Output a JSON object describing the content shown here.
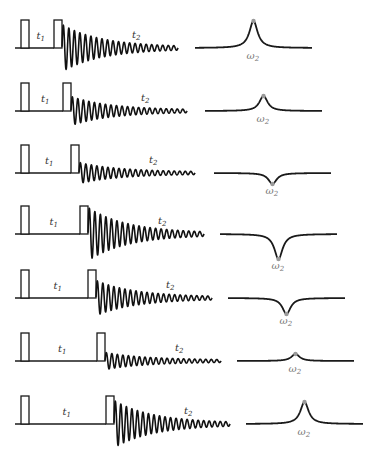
{
  "diagram": {
    "title": "",
    "labels": {
      "t1": "t",
      "t1_sub": "1",
      "t2": "t",
      "t2_sub": "2",
      "omega": "ω",
      "omega_sub": "2"
    },
    "colors": {
      "line": "#1a1a1a",
      "peak_marker": "#9a9a9a",
      "omega_label": "#777777"
    },
    "pulse": {
      "width": 8,
      "height": 28,
      "first_x": 21
    },
    "fid": {
      "length": 116,
      "cycles": 21,
      "decay": 3.0
    },
    "spectrum": {
      "width": 117,
      "linewidth": 5
    },
    "rows": [
      {
        "baseline_y": 48,
        "pulse2_x": 54,
        "fid_amp": 22,
        "spec_x": 195,
        "spec_amp": 27
      },
      {
        "baseline_y": 111,
        "pulse2_x": 63,
        "fid_amp": 13,
        "spec_x": 205,
        "spec_amp": 15
      },
      {
        "baseline_y": 173,
        "pulse2_x": 71,
        "fid_amp": 9,
        "spec_x": 214,
        "spec_amp": -11
      },
      {
        "baseline_y": 234,
        "pulse2_x": 80,
        "fid_amp": 25,
        "spec_x": 220,
        "spec_amp": -25
      },
      {
        "baseline_y": 298,
        "pulse2_x": 88,
        "fid_amp": 16,
        "spec_x": 228,
        "spec_amp": -16
      },
      {
        "baseline_y": 361,
        "pulse2_x": 97,
        "fid_amp": 7,
        "spec_x": 237,
        "spec_amp": 7
      },
      {
        "baseline_y": 424,
        "pulse2_x": 106,
        "fid_amp": 22,
        "spec_x": 246,
        "spec_amp": 22
      }
    ]
  }
}
